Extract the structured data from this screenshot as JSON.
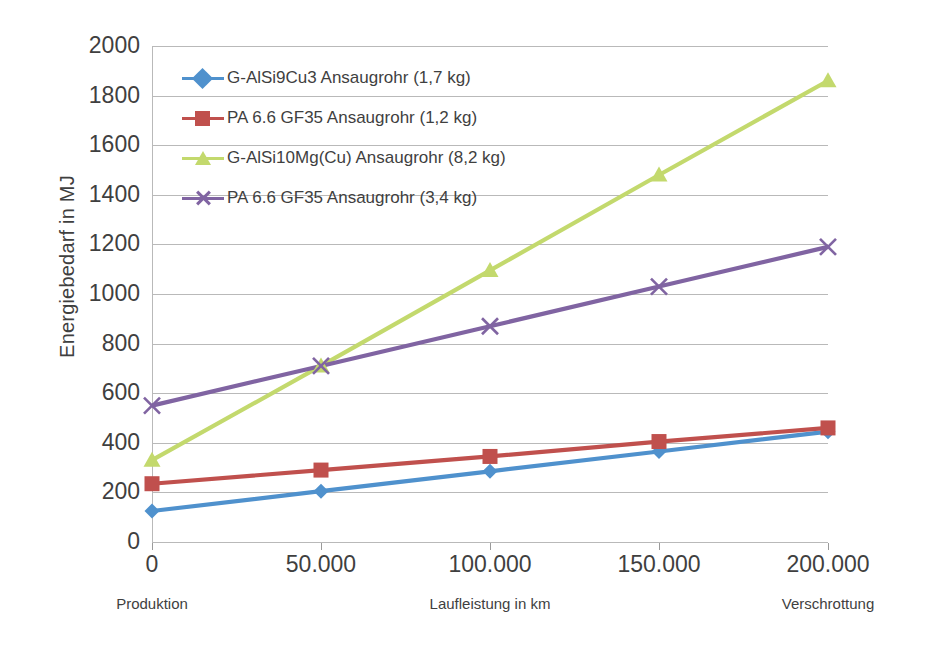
{
  "chart_data": {
    "type": "line",
    "title": "",
    "xlabel": "Laufleistung in km",
    "ylabel": "Energiebedarf  in MJ",
    "x": [
      0,
      50000,
      100000,
      150000,
      200000
    ],
    "xtick_labels": [
      "0",
      "50.000",
      "100.000",
      "150.000",
      "200.000"
    ],
    "xlim": [
      0,
      200000
    ],
    "ylim": [
      0,
      2000
    ],
    "ytick_labels": [
      "2000",
      "1800",
      "1600",
      "1400",
      "1200",
      "1000",
      "800",
      "600",
      "400",
      "200",
      "0"
    ],
    "ytick_values": [
      2000,
      1800,
      1600,
      1400,
      1200,
      1000,
      800,
      600,
      400,
      200,
      0
    ],
    "grid": true,
    "legend_position": "inside-top-left",
    "x_captions": [
      {
        "text": "Produktion",
        "at": 0
      },
      {
        "text": "Laufleistung in km",
        "at": 100000
      },
      {
        "text": "Verschrottung",
        "at": 200000
      }
    ],
    "series": [
      {
        "name": "G-AlSi9Cu3 Ansaugrohr (1,7 kg)",
        "color": "#4f91cd",
        "marker": "diamond",
        "values": [
          125,
          205,
          285,
          365,
          445
        ]
      },
      {
        "name": "PA 6.6 GF35 Ansaugrohr (1,2 kg)",
        "color": "#c0504d",
        "marker": "square",
        "values": [
          235,
          290,
          345,
          405,
          460
        ]
      },
      {
        "name": "G-AlSi10Mg(Cu) Ansaugrohr (8,2 kg)",
        "color": "#c3d96d",
        "marker": "triangle",
        "values": [
          330,
          710,
          1095,
          1480,
          1860
        ]
      },
      {
        "name": "PA 6.6 GF35  Ansaugrohr (3,4 kg)",
        "color": "#8064a2",
        "marker": "cross",
        "values": [
          550,
          710,
          870,
          1030,
          1190
        ]
      }
    ]
  },
  "colors": {
    "gridline": "#b9b9b9",
    "text": "#3f3f3f",
    "background": "#ffffff"
  }
}
